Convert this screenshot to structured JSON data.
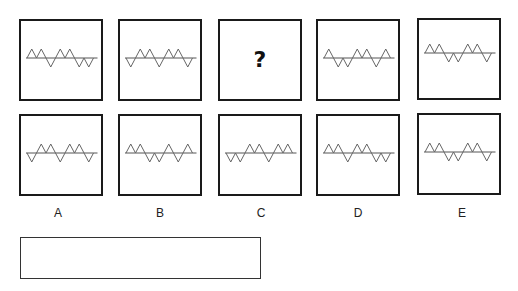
{
  "puzzle": {
    "colors": {
      "border": "#1a1a1a",
      "line": "#555555",
      "stroke": "#666666"
    },
    "sequence": [
      {
        "id": "s1",
        "pattern": [
          "up",
          "up",
          "down",
          "up",
          "up",
          "down",
          "down"
        ],
        "baseline_offset": 0
      },
      {
        "id": "s2",
        "pattern": [
          "down",
          "up",
          "up",
          "down",
          "up",
          "up",
          "down"
        ],
        "baseline_offset": 0
      },
      {
        "id": "s3",
        "question": "?"
      },
      {
        "id": "s4",
        "pattern": [
          "up",
          "down",
          "down",
          "up",
          "up",
          "down",
          "up"
        ],
        "baseline_offset": 0
      },
      {
        "id": "s5",
        "pattern": [
          "up",
          "up",
          "down",
          "down",
          "up",
          "up",
          "down"
        ],
        "baseline_offset": -4
      }
    ],
    "options": [
      {
        "label": "A",
        "pattern": [
          "down",
          "up",
          "up",
          "down",
          "up",
          "up",
          "down"
        ]
      },
      {
        "label": "B",
        "pattern": [
          "up",
          "up",
          "down",
          "down",
          "up",
          "down",
          "up"
        ]
      },
      {
        "label": "C",
        "pattern": [
          "down",
          "down",
          "up",
          "up",
          "down",
          "up",
          "up"
        ]
      },
      {
        "label": "D",
        "pattern": [
          "up",
          "up",
          "down",
          "up",
          "up",
          "down",
          "down"
        ]
      },
      {
        "label": "E",
        "pattern": [
          "up",
          "up",
          "down",
          "down",
          "up",
          "up",
          "down"
        ]
      }
    ],
    "answer_value": ""
  }
}
